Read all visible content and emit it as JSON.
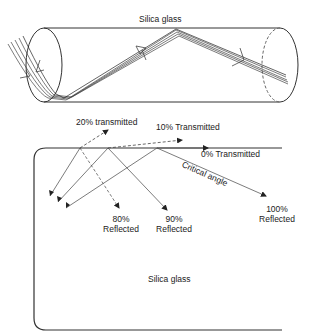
{
  "figure": {
    "top_diagram": {
      "title": "Silica glass",
      "description": "Light rays entering a silica glass cylinder and propagating via total internal reflection"
    },
    "bottom_diagram": {
      "medium_label": "Silica glass",
      "labels": {
        "t20": "20% transmitted",
        "t10": "10% Transmitted",
        "t0": "0% Transmitted",
        "critical": "Critical angle",
        "r80_pct": "80%",
        "r80_word": "Reflected",
        "r90_pct": "90%",
        "r90_word": "Reflected",
        "r100_pct": "100%",
        "r100_word": "Reflected"
      }
    },
    "colors": {
      "line": "#333333",
      "light_line": "#777777",
      "background": "#ffffff"
    }
  }
}
